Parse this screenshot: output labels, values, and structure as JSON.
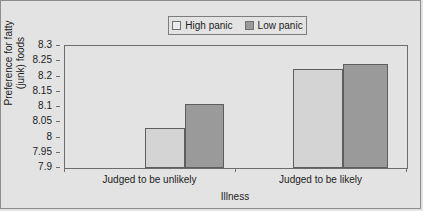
{
  "chart_data": {
    "type": "bar",
    "title": "",
    "xlabel": "Illness",
    "ylabel": "Preference for fatty (junk) foods",
    "ylabel_line1": "Preference for fatty",
    "ylabel_line2": "(junk) foods",
    "categories": [
      "Judged to be unlikely",
      "Judged to be likely"
    ],
    "series": [
      {
        "name": "High panic",
        "values": [
          8.03,
          8.225
        ],
        "color": "#d4d4d4"
      },
      {
        "name": "Low panic",
        "values": [
          8.11,
          8.24
        ],
        "color": "#9a9a9a"
      }
    ],
    "ylim": [
      7.9,
      8.3
    ],
    "yticks": [
      "8.3",
      "8.25",
      "8.2",
      "8.15",
      "8.1",
      "8.05",
      "8",
      "7.95",
      "7.9"
    ],
    "ytick_values": [
      8.3,
      8.25,
      8.2,
      8.15,
      8.1,
      8.05,
      8.0,
      7.95,
      7.9
    ],
    "grid": false,
    "legend_position": "top-center"
  },
  "legend": {
    "items": [
      {
        "label": "High panic",
        "swatch": "light-gray-swatch"
      },
      {
        "label": "Low panic",
        "swatch": "dark-gray-swatch"
      }
    ]
  },
  "colors": {
    "background": "#e3e3e3",
    "axis": "#6d6d6d",
    "bar_high_panic": "#d4d4d4",
    "bar_low_panic": "#9a9a9a",
    "text": "#1c1c1c"
  }
}
